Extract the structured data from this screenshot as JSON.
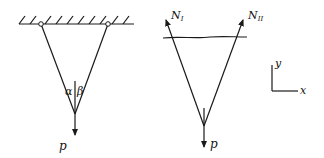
{
  "left_figure": {
    "load_label": "p",
    "angle_left_label": "α",
    "angle_right_label": "β",
    "support": "fixed-ceiling-with-two-pins"
  },
  "right_figure": {
    "force_left_label": "N",
    "force_left_sub": "I",
    "force_right_label": "N",
    "force_right_sub": "II",
    "load_label": "p",
    "section_cut": "wavy-cut-line"
  },
  "axes": {
    "x_label": "x",
    "y_label": "y"
  },
  "colors": {
    "stroke": "#1a1a1a",
    "background": "#ffffff"
  }
}
